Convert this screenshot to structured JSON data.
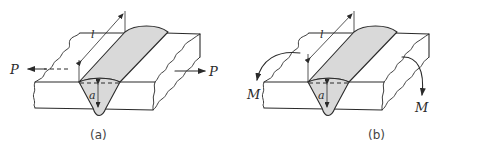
{
  "figure": {
    "panels": [
      {
        "id": "a",
        "caption": "(a)",
        "load_type": "tension",
        "labels": {
          "left_force": "P",
          "right_force": "P",
          "throat": "a",
          "length": "l"
        }
      },
      {
        "id": "b",
        "caption": "(b)",
        "load_type": "bending",
        "labels": {
          "left_moment": "M",
          "right_moment": "M",
          "throat": "a",
          "length": "l"
        }
      }
    ],
    "colors": {
      "line": "#2a2a2a",
      "weld_fill": "#d9d9d9",
      "background": "#ffffff"
    }
  }
}
